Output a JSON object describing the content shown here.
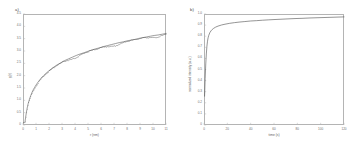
{
  "figure": {
    "background": "#ffffff",
    "frame_color": "#b4b4b4",
    "curve_color": "#4d4d4d"
  },
  "panels": [
    {
      "label": "a)",
      "chart_data": {
        "type": "line",
        "title": "",
        "xlabel": "r (nm)",
        "ylabel": "g(r)",
        "xlim": [
          0,
          11
        ],
        "ylim": [
          0,
          4.5
        ],
        "grid": false,
        "legend": null,
        "xticks": [
          0,
          1,
          2,
          3,
          4,
          5,
          6,
          7,
          8,
          9,
          10,
          11
        ],
        "xticklabels": [
          "0",
          "1",
          "2",
          "3",
          "4",
          "5",
          "6",
          "7",
          "8",
          "9",
          "10",
          "11"
        ],
        "yticks": [
          0,
          0.5,
          1.0,
          1.5,
          2.0,
          2.5,
          3.0,
          3.5,
          4.0,
          4.5
        ],
        "yticklabels": [
          "0",
          "0.5",
          "1.0",
          "1.5",
          "2.0",
          "2.5",
          "3.0",
          "3.5",
          "4.0",
          "4.5"
        ],
        "series": [
          {
            "name": "data",
            "x": [
              0.15,
              0.2,
              0.25,
              0.3,
              0.35,
              0.4,
              0.5,
              0.6,
              0.7,
              0.8,
              0.9,
              1.0,
              1.2,
              1.4,
              1.6,
              1.8,
              2.0,
              2.3,
              2.6,
              2.9,
              3.2,
              3.5,
              3.8,
              4.1,
              4.4,
              4.7,
              5.0,
              5.3,
              5.6,
              5.9,
              6.2,
              6.5,
              6.8,
              7.1,
              7.4,
              7.7,
              8.0,
              8.3,
              8.6,
              8.9,
              9.2,
              9.5,
              9.8,
              10.1,
              10.4,
              10.7,
              11.0
            ],
            "y": [
              0.12,
              0.3,
              0.48,
              0.63,
              0.76,
              0.87,
              1.05,
              1.2,
              1.33,
              1.44,
              1.53,
              1.62,
              1.77,
              1.9,
              2.01,
              2.11,
              2.2,
              2.32,
              2.43,
              2.52,
              2.61,
              2.68,
              2.75,
              2.82,
              2.88,
              2.93,
              2.99,
              3.04,
              3.09,
              3.13,
              3.18,
              3.22,
              3.26,
              3.3,
              3.34,
              3.37,
              3.41,
              3.44,
              3.47,
              3.51,
              3.54,
              3.57,
              3.6,
              3.63,
              3.65,
              3.68,
              3.71
            ]
          }
        ],
        "annotations": [
          "saturating logarithmic growth with small periodic dips along the upper branch"
        ]
      }
    },
    {
      "label": "b)",
      "chart_data": {
        "type": "line",
        "title": "",
        "xlabel": "time (s)",
        "ylabel": "normalized intensity (a.u.)",
        "xlim": [
          0,
          120
        ],
        "ylim": [
          0,
          1.0
        ],
        "grid": false,
        "legend": null,
        "xticks": [
          0,
          20,
          40,
          60,
          80,
          100,
          120
        ],
        "xticklabels": [
          "0",
          "20",
          "40",
          "60",
          "80",
          "100",
          "120"
        ],
        "yticks": [
          0,
          0.1,
          0.2,
          0.3,
          0.4,
          0.5,
          0.6,
          0.7,
          0.8,
          0.9,
          1.0
        ],
        "yticklabels": [
          "0",
          "0.1",
          "0.2",
          "0.3",
          "0.4",
          "0.5",
          "0.6",
          "0.7",
          "0.8",
          "0.9",
          "1.0"
        ],
        "series": [
          {
            "name": "data",
            "x": [
              0.5,
              1.0,
              1.5,
              2.0,
              2.5,
              3.0,
              3.5,
              4.0,
              5.0,
              6.0,
              7.0,
              8.0,
              10.0,
              12.0,
              15.0,
              18.0,
              22.0,
              26.0,
              30.0,
              35.0,
              40.0,
              45.0,
              50.0,
              55.0,
              60.0,
              66.0,
              72.0,
              78.0,
              84.0,
              90.0,
              96.0,
              102.0,
              108.0,
              114.0,
              120.0
            ],
            "y": [
              0.26,
              0.42,
              0.55,
              0.64,
              0.71,
              0.755,
              0.785,
              0.805,
              0.832,
              0.848,
              0.86,
              0.869,
              0.882,
              0.891,
              0.901,
              0.908,
              0.916,
              0.922,
              0.927,
              0.932,
              0.937,
              0.94,
              0.944,
              0.947,
              0.95,
              0.953,
              0.956,
              0.959,
              0.961,
              0.964,
              0.966,
              0.968,
              0.97,
              0.972,
              0.974
            ]
          }
        ],
        "annotations": [
          "sharp knee near the origin followed by a long slow plateau"
        ]
      }
    }
  ]
}
